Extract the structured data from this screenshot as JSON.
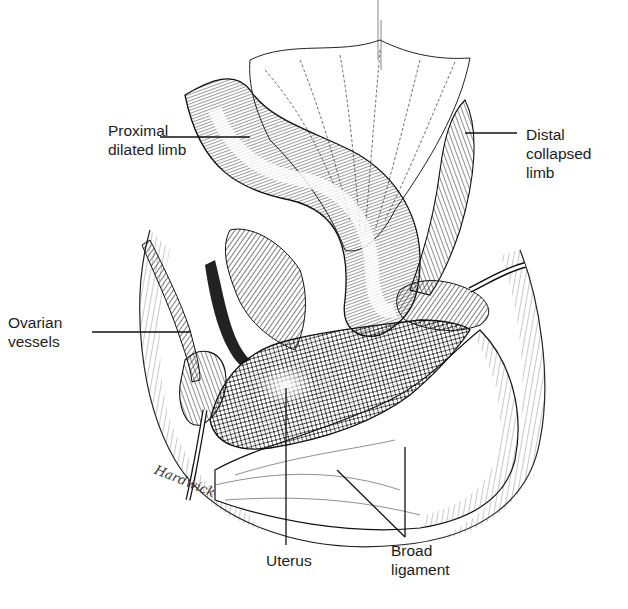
{
  "figure": {
    "type": "anatomical-illustration",
    "signature": "Hardwick"
  },
  "labels": {
    "proximal": {
      "line1": "Proximal",
      "line2": "dilated limb"
    },
    "distal": {
      "line1": "Distal",
      "line2": "collapsed",
      "line3": "limb"
    },
    "ovarian": {
      "line1": "Ovarian",
      "line2": "vessels"
    },
    "uterus": {
      "line1": "Uterus"
    },
    "broad": {
      "line1": "Broad",
      "line2": "ligament"
    }
  },
  "colors": {
    "ink": "#1a1a1a",
    "background": "#ffffff"
  }
}
